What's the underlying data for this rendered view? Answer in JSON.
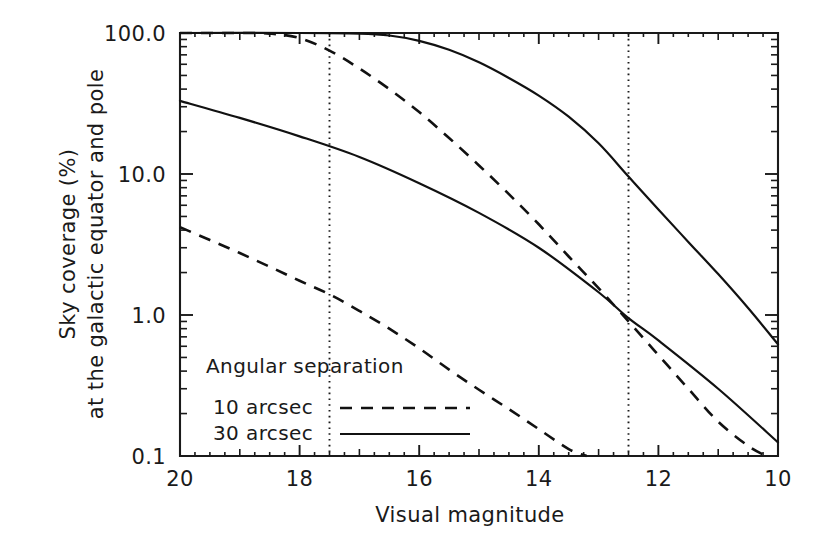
{
  "chart_data": {
    "type": "line",
    "title": "",
    "xlabel": "Visual magnitude",
    "ylabel_line1": "Sky coverage (%)",
    "ylabel_line2": "at the galactic equator and pole",
    "xlim": [
      20,
      10
    ],
    "ylim": [
      0.1,
      100
    ],
    "yscale": "log",
    "xscale": "linear",
    "grid": false,
    "x_ticks": [
      "20",
      "18",
      "16",
      "14",
      "12",
      "10"
    ],
    "x_tick_values": [
      20,
      18,
      16,
      14,
      12,
      10
    ],
    "y_ticks": [
      "100.0",
      "10.0",
      "1.0",
      "0.1"
    ],
    "y_tick_values": [
      100.0,
      10.0,
      1.0,
      0.1
    ],
    "legend_title": "Angular separation",
    "legend_position": "lower-left-inside",
    "series": [
      {
        "name": "10 arcsec",
        "style": "dashed",
        "comment": "upper dashed = galactic equator, 10 arcsec",
        "x": [
          20.0,
          19.0,
          18.5,
          18.0,
          17.5,
          17.0,
          16.5,
          16.0,
          15.5,
          15.0,
          14.5,
          14.0,
          13.5,
          13.0,
          12.5,
          12.0,
          11.5,
          11.0,
          10.5,
          10.2
        ],
        "y": [
          100.0,
          100.0,
          99.0,
          92.0,
          75.0,
          56.0,
          40.0,
          27.5,
          18.0,
          11.5,
          7.2,
          4.4,
          2.6,
          1.55,
          0.9,
          0.52,
          0.3,
          0.175,
          0.118,
          0.1
        ]
      },
      {
        "name": "10 arcsec",
        "style": "dashed",
        "comment": "lower dashed = galactic pole, 10 arcsec",
        "x": [
          20.0,
          19.5,
          19.0,
          18.5,
          18.0,
          17.5,
          17.0,
          16.5,
          16.0,
          15.5,
          15.0,
          14.5,
          14.0,
          13.5,
          13.2
        ],
        "y": [
          4.2,
          3.4,
          2.75,
          2.2,
          1.75,
          1.4,
          1.07,
          0.8,
          0.58,
          0.41,
          0.295,
          0.215,
          0.155,
          0.112,
          0.1
        ]
      },
      {
        "name": "30 arcsec",
        "style": "solid",
        "comment": "upper solid = galactic equator, 30 arcsec",
        "x": [
          20.0,
          18.0,
          17.0,
          16.5,
          16.0,
          15.5,
          15.0,
          14.5,
          14.0,
          13.5,
          13.0,
          12.5,
          12.0,
          11.5,
          11.0,
          10.5,
          10.0
        ],
        "y": [
          100.0,
          100.0,
          99.0,
          96.0,
          88.0,
          76.0,
          62.0,
          48.0,
          36.0,
          25.5,
          16.5,
          9.6,
          5.6,
          3.3,
          1.95,
          1.12,
          0.62
        ]
      },
      {
        "name": "30 arcsec",
        "style": "solid",
        "comment": "lower solid = galactic pole, 30 arcsec",
        "x": [
          20.0,
          19.0,
          18.0,
          17.0,
          16.0,
          15.0,
          14.0,
          13.0,
          12.5,
          12.0,
          11.0,
          10.0
        ],
        "y": [
          33.0,
          25.0,
          18.5,
          13.2,
          8.6,
          5.3,
          3.0,
          1.45,
          0.95,
          0.66,
          0.3,
          0.125
        ]
      }
    ],
    "vertical_reference_lines": [
      {
        "x": 17.5,
        "style": "dotted"
      },
      {
        "x": 12.5,
        "style": "dotted"
      }
    ],
    "legend_entries": [
      {
        "label": "10 arcsec",
        "style": "dashed"
      },
      {
        "label": "30 arcsec",
        "style": "solid"
      }
    ],
    "colors": {
      "ink": "#111111",
      "background": "#ffffff"
    }
  }
}
